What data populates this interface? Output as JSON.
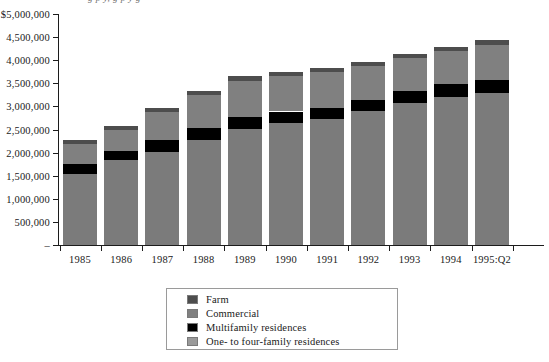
{
  "title_sliver": "g  p  y,  g  p  y  g",
  "chart_data": {
    "type": "bar",
    "stacked": true,
    "title": "",
    "subtitle": "",
    "xlabel": "",
    "ylabel": "",
    "grid": false,
    "legend_position": "bottom-center",
    "ylim": [
      0,
      5000000
    ],
    "ytick_values": [
      0,
      500000,
      1000000,
      1500000,
      2000000,
      2500000,
      3000000,
      3500000,
      4000000,
      4500000,
      5000000
    ],
    "ytick_labels": [
      "–",
      "500,000",
      "1,000,000",
      "1,500,000",
      "2,000,000",
      "2,500,000",
      "3,000,000",
      "3,500,000",
      "4,000,000",
      "4,500,000",
      "$5,000,000"
    ],
    "categories": [
      "1985",
      "1986",
      "1987",
      "1988",
      "1989",
      "1990",
      "1991",
      "1992",
      "1993",
      "1994",
      "1995:Q2"
    ],
    "series": [
      {
        "name": "One- to four-family residences",
        "color": "#7b7b7b",
        "values": [
          1540000,
          1830000,
          2020000,
          2280000,
          2520000,
          2640000,
          2720000,
          2890000,
          3080000,
          3200000,
          3290000
        ]
      },
      {
        "name": "Multifamily residences",
        "color": "#000000",
        "values": [
          210000,
          200000,
          250000,
          260000,
          250000,
          250000,
          250000,
          250000,
          250000,
          280000,
          290000
        ]
      },
      {
        "name": "Commercial",
        "color": "#808080",
        "values": [
          440000,
          470000,
          610000,
          700000,
          790000,
          770000,
          780000,
          740000,
          710000,
          720000,
          760000
        ]
      },
      {
        "name": "Farm",
        "color": "#4d4d4d",
        "values": [
          90000,
          80000,
          90000,
          90000,
          90000,
          90000,
          90000,
          90000,
          90000,
          90000,
          90000
        ]
      }
    ],
    "totals": [
      2280000,
      2580000,
      2970000,
      3330000,
      3650000,
      3750000,
      3840000,
      3970000,
      4130000,
      4290000,
      4430000
    ]
  },
  "legend": {
    "items": [
      {
        "label": "Farm",
        "swatch": "farm"
      },
      {
        "label": "Commercial",
        "swatch": "commercial"
      },
      {
        "label": "Multifamily residences",
        "swatch": "multi"
      },
      {
        "label": "One- to four-family residences",
        "swatch": "onefour"
      }
    ]
  }
}
